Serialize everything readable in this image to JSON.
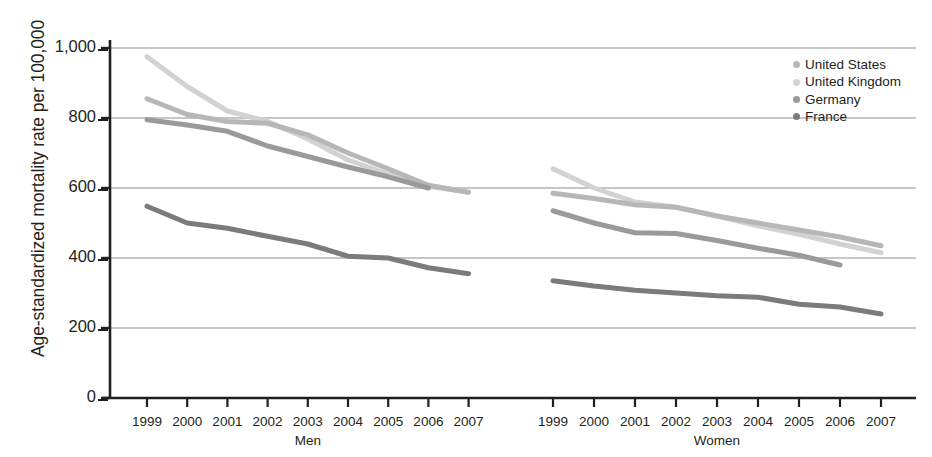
{
  "chart_data": {
    "type": "line",
    "title": "",
    "xlabel": "",
    "ylabel": "Age-standardized mortality rate per 100,000",
    "ylim": [
      0,
      1000
    ],
    "ytick_labels": [
      "1,000",
      "800",
      "600",
      "400",
      "200",
      "0"
    ],
    "ytick_values": [
      1000,
      800,
      600,
      400,
      200,
      0
    ],
    "grid": true,
    "grid_axis": "y",
    "legend_position": "top-right",
    "panels": [
      {
        "name": "Men",
        "label": "Men",
        "x": [
          1999,
          2000,
          2001,
          2002,
          2003,
          2004,
          2005,
          2006,
          2007
        ],
        "xtick_labels": [
          "1999",
          "2000",
          "2001",
          "2002",
          "2003",
          "2004",
          "2005",
          "2006",
          "2007"
        ],
        "series": [
          {
            "name": "United Kingdom",
            "color": "#d2d2d2",
            "x": [
              1999,
              2000,
              2001,
              2002,
              2003,
              2004,
              2005,
              2006,
              2007
            ],
            "values": [
              975,
              890,
              820,
              790,
              740,
              680,
              640,
              605,
              588
            ]
          },
          {
            "name": "United States",
            "color": "#b7b7b7",
            "x": [
              1999,
              2000,
              2001,
              2002,
              2003,
              2004,
              2005,
              2006,
              2007
            ],
            "values": [
              855,
              810,
              790,
              785,
              752,
              700,
              655,
              608,
              588
            ]
          },
          {
            "name": "Germany",
            "color": "#9a9a9a",
            "x": [
              1999,
              2000,
              2001,
              2002,
              2003,
              2004,
              2005,
              2006
            ],
            "values": [
              795,
              780,
              762,
              720,
              690,
              660,
              632,
              600
            ]
          },
          {
            "name": "France",
            "color": "#7b7b7b",
            "x": [
              1999,
              2000,
              2001,
              2002,
              2003,
              2004,
              2005,
              2006,
              2007
            ],
            "values": [
              548,
              500,
              485,
              462,
              440,
              405,
              400,
              372,
              355
            ]
          }
        ]
      },
      {
        "name": "Women",
        "label": "Women",
        "x": [
          1999,
          2000,
          2001,
          2002,
          2003,
          2004,
          2005,
          2006,
          2007
        ],
        "xtick_labels": [
          "1999",
          "2000",
          "2001",
          "2002",
          "2003",
          "2004",
          "2005",
          "2006",
          "2007"
        ],
        "series": [
          {
            "name": "United Kingdom",
            "color": "#d2d2d2",
            "x": [
              1999,
              2000,
              2001,
              2002,
              2003,
              2004,
              2005,
              2006,
              2007
            ],
            "values": [
              655,
              600,
              560,
              545,
              520,
              492,
              468,
              440,
              415
            ]
          },
          {
            "name": "United States",
            "color": "#b7b7b7",
            "x": [
              1999,
              2000,
              2001,
              2002,
              2003,
              2004,
              2005,
              2006,
              2007
            ],
            "values": [
              585,
              570,
              552,
              545,
              520,
              500,
              480,
              460,
              435
            ]
          },
          {
            "name": "Germany",
            "color": "#9a9a9a",
            "x": [
              1999,
              2000,
              2001,
              2002,
              2003,
              2004,
              2005,
              2006
            ],
            "values": [
              535,
              500,
              472,
              470,
              450,
              428,
              408,
              380
            ]
          },
          {
            "name": "France",
            "color": "#7b7b7b",
            "x": [
              1999,
              2000,
              2001,
              2002,
              2003,
              2004,
              2005,
              2006,
              2007
            ],
            "values": [
              335,
              320,
              308,
              300,
              292,
              288,
              268,
              260,
              240
            ]
          }
        ]
      }
    ],
    "legend": [
      {
        "label": "United States",
        "color": "#b7b7b7"
      },
      {
        "label": "United Kingdom",
        "color": "#d2d2d2"
      },
      {
        "label": "Germany",
        "color": "#9a9a9a"
      },
      {
        "label": "France",
        "color": "#7b7b7b"
      }
    ]
  },
  "axis": {
    "ylabel": "Age-standardized mortality rate per 100,000"
  }
}
